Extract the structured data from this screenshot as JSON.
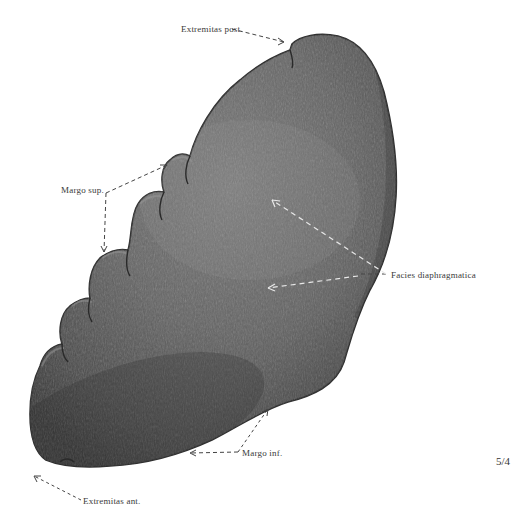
{
  "figure": {
    "plate_number": "5/4",
    "colors": {
      "background": "#ffffff",
      "organ_light": "#7a7a7a",
      "organ_mid": "#5e5e5e",
      "organ_dark": "#3c3c3c",
      "outline": "#2e2e2e",
      "leader_on_white": "#444444",
      "leader_on_organ": "#e6e6e6",
      "label_text": "#3a3a3a"
    }
  },
  "labels": {
    "extremitas_post": "Extremitas post.",
    "margo_sup": "Margo sup.",
    "facies_diaphragmatica": "Facies diaphragmatica",
    "margo_inf": "Margo inf.",
    "extremitas_ant": "Extremitas ant."
  }
}
